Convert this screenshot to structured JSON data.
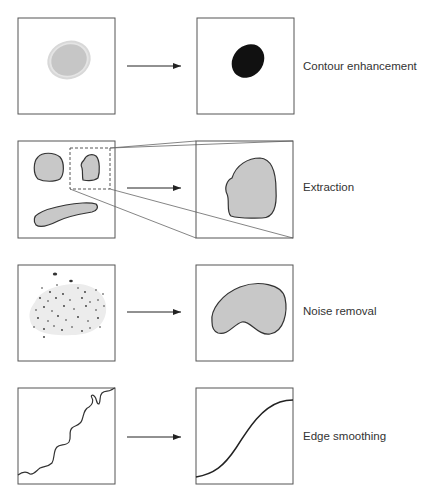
{
  "rows": [
    {
      "id": "contour",
      "label": "Contour enhancement",
      "description": "Faint gray blob becomes solid black blob"
    },
    {
      "id": "extraction",
      "label": "Extraction",
      "description": "Selected region (dashed box) is extracted and enlarged"
    },
    {
      "id": "noise",
      "label": "Noise removal",
      "description": "Speckled noisy region becomes clean filled shape"
    },
    {
      "id": "smoothing",
      "label": "Edge smoothing",
      "description": "Jagged wavy edge becomes smooth curve"
    }
  ],
  "colors": {
    "frame": "#555555",
    "fill_gray": "#c8c8c8",
    "blob_black": "#111111",
    "outline": "#333333",
    "text": "#333333"
  }
}
